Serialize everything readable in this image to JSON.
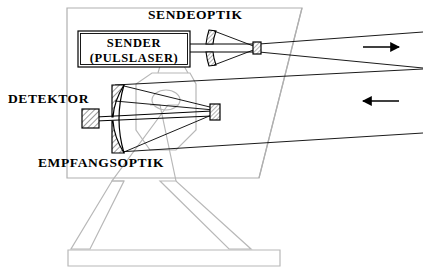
{
  "diagram": {
    "language": "de",
    "background_color": "#ffffff",
    "stroke_color": "#000000",
    "structure_color": "#b4b4b4",
    "hatch_color": "#555555",
    "labels": {
      "transmit_optics": "SENDEOPTIK",
      "sender_line1": "SENDER",
      "sender_line2": "(PULSLASER)",
      "detector": "DETEKTOR",
      "receive_optics": "EMPFANGSOPTIK"
    },
    "beams": {
      "outgoing_arrow": "arrow-right",
      "incoming_arrow": "arrow-left"
    },
    "components": [
      {
        "name": "sender-pulslaser-box",
        "kind": "box"
      },
      {
        "name": "transmit-primary-mirror",
        "kind": "mirror"
      },
      {
        "name": "transmit-secondary-mirror",
        "kind": "mirror"
      },
      {
        "name": "receive-primary-mirror",
        "kind": "mirror"
      },
      {
        "name": "receive-secondary-mirror",
        "kind": "mirror"
      },
      {
        "name": "detector-element",
        "kind": "sensor"
      },
      {
        "name": "instrument-housing",
        "kind": "enclosure"
      },
      {
        "name": "tripod-mount",
        "kind": "support"
      }
    ]
  }
}
